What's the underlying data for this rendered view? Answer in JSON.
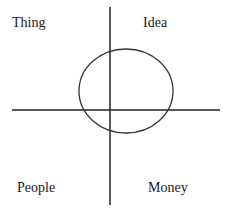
{
  "diagram": {
    "quadrants": {
      "top_left": "Thing",
      "top_right": "Idea",
      "bottom_left": "People",
      "bottom_right": "Money"
    },
    "colors": {
      "line": "#222222",
      "text": "#1a1a1a",
      "background": "#ffffff"
    },
    "axes": {
      "horizontal": {
        "x1": 12,
        "x2": 220,
        "y": 110
      },
      "vertical": {
        "x": 110,
        "y1": 7,
        "y2": 205
      }
    },
    "ellipse": {
      "cx": 126,
      "cy": 91,
      "rx": 47,
      "ry": 42
    }
  }
}
